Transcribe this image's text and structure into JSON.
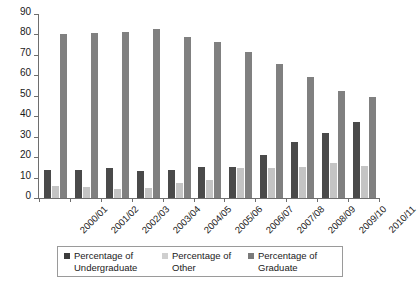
{
  "chart_data": {
    "type": "bar",
    "title": "",
    "xlabel": "",
    "ylabel": "",
    "ylim": [
      0,
      90
    ],
    "ytick_step": 10,
    "yticks": [
      90,
      80,
      70,
      60,
      50,
      40,
      30,
      20,
      10,
      0
    ],
    "grid": false,
    "legend_position": "bottom",
    "categories": [
      "2000/01",
      "2001/02",
      "2002/03",
      "2003/04",
      "2004/05",
      "2005/06",
      "2006/07",
      "2007/08",
      "2008/09",
      "2009/10",
      "2010/11"
    ],
    "series": [
      {
        "name": "Percentage of Undergraduate",
        "color": "#4a4a4a",
        "values": [
          13.5,
          13.5,
          14.5,
          13,
          13.5,
          15,
          15,
          21,
          27.5,
          32,
          37
        ]
      },
      {
        "name": "Percentage of Other",
        "color": "#c4c4c4",
        "values": [
          6,
          5.5,
          4.5,
          5,
          7.5,
          9,
          14.5,
          14.5,
          15,
          17,
          15.5
        ]
      },
      {
        "name": "Percentage of Graduate",
        "color": "#808080",
        "values": [
          80,
          80.5,
          81,
          82.5,
          79,
          76.5,
          71.5,
          65.5,
          59,
          52.5,
          49.5
        ]
      }
    ]
  },
  "legend": {
    "entries": [
      {
        "label": "Percentage of\nUndergraduate",
        "color": "#3c3c3c"
      },
      {
        "label": "Percentage of\nOther",
        "color": "#cfcfcf"
      },
      {
        "label": "Percentage of\nGraduate",
        "color": "#7a7a7a"
      }
    ]
  },
  "colors": {
    "undergraduate": "#4a4a4a",
    "other": "#c4c4c4",
    "graduate": "#808080",
    "axis": "#6e6e6e",
    "text": "#1a1a1a",
    "background": "#ffffff"
  }
}
